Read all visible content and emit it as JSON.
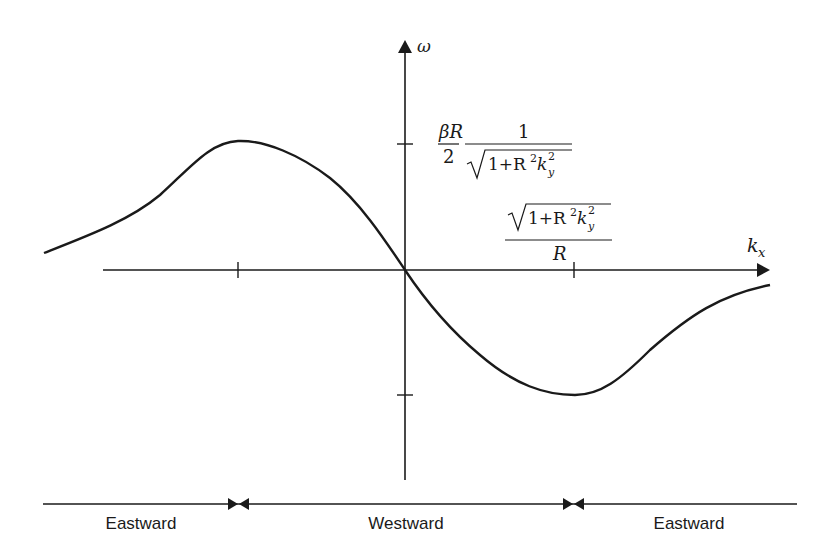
{
  "diagram": {
    "type": "dispersion-relation",
    "axes": {
      "x_label": "k",
      "x_label_sub": "x",
      "y_label": "ω"
    },
    "annotations": {
      "max_freq": {
        "prefix_num": "βR",
        "prefix_den": "2",
        "frac_num": "1",
        "frac_den_sqrt": "1+R",
        "frac_den_sup": "2",
        "frac_den_k": "k",
        "frac_den_ksup": "2",
        "frac_den_ksub": "y"
      },
      "k_at_max": {
        "num_sqrt": "1+R",
        "num_sup": "2",
        "num_k": "k",
        "num_ksup": "2",
        "num_ksub": "y",
        "den": "R"
      }
    },
    "regions": [
      {
        "label": "Eastward"
      },
      {
        "label": "Westward"
      },
      {
        "label": "Eastward"
      }
    ],
    "colors": {
      "ink": "#1a1a1a",
      "background": "#ffffff"
    }
  }
}
